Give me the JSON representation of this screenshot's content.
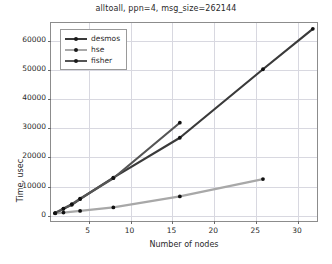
{
  "chart_data": {
    "type": "line",
    "title": "alltoall, ppn=4, msg_size=262144",
    "xlabel": "Number of nodes",
    "ylabel": "Time, usec",
    "xlim": [
      0.5,
      32.5
    ],
    "ylim": [
      -2500,
      66000
    ],
    "xticks": [
      5,
      10,
      15,
      20,
      25,
      30
    ],
    "yticks": [
      0,
      10000,
      20000,
      30000,
      40000,
      50000,
      60000
    ],
    "grid": true,
    "legend_position": "upper left",
    "series": [
      {
        "name": "desmos",
        "color": "#3a3a3a",
        "marker": "o",
        "x": [
          1,
          2,
          3,
          4,
          8,
          16,
          26,
          32
        ],
        "y": [
          200,
          1700,
          3100,
          5100,
          12500,
          26300,
          50000,
          64000
        ]
      },
      {
        "name": "hse",
        "color": "#a8a8a8",
        "marker": "o",
        "x": [
          1,
          2,
          4,
          8,
          16,
          26
        ],
        "y": [
          150,
          400,
          1000,
          2200,
          6000,
          12000
        ]
      },
      {
        "name": "fisher",
        "color": "#555555",
        "marker": "o",
        "x": [
          1,
          2,
          3,
          4,
          8,
          16
        ],
        "y": [
          250,
          1800,
          3300,
          5200,
          12300,
          31500
        ]
      }
    ]
  },
  "legend": {
    "items": [
      {
        "label": "desmos"
      },
      {
        "label": "hse"
      },
      {
        "label": "fisher"
      }
    ]
  }
}
